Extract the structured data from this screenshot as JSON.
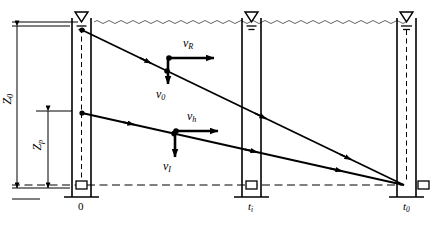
{
  "figure": {
    "type": "hydrogeology-well-drawdown-diagram",
    "background_color": "#ffffff",
    "line_color": "#000000",
    "width": 432,
    "height": 225
  },
  "water_table": {
    "symbol": "water-level-triangle",
    "wavy_line": true,
    "y": 22
  },
  "wells": [
    {
      "id": "well-left",
      "label": "0",
      "x": 78,
      "has_water_symbol": true,
      "has_dashed_riser": true,
      "has_screen_box": true
    },
    {
      "id": "well-middle",
      "label": "t",
      "label_sub": "i",
      "x": 249,
      "has_water_symbol": true,
      "has_dashed_riser": false,
      "has_screen_box": true
    },
    {
      "id": "well-right",
      "label": "t",
      "label_sub": "0",
      "x": 404,
      "has_water_symbol": true,
      "has_dashed_riser": true,
      "has_screen_box": true
    }
  ],
  "axis_labels": {
    "left_well": "0",
    "middle_well": "t",
    "middle_well_sub": "i",
    "right_well": "t",
    "right_well_sub": "0"
  },
  "dimensions": [
    {
      "name": "Z0",
      "label": "Z",
      "sub": "0",
      "orientation": "vertical",
      "from_y": 28,
      "to_y": 188,
      "x": 17,
      "description": "total aquifer depth"
    },
    {
      "name": "Zp",
      "label": "Z",
      "sub": "p",
      "orientation": "vertical",
      "from_y": 110,
      "to_y": 188,
      "x": 48,
      "description": "partial penetration depth"
    }
  ],
  "vectors": [
    {
      "name": "v-R",
      "label": "v",
      "sub": "R",
      "direction": "horizontal-right",
      "x": 196,
      "y": 57,
      "label_x": 186,
      "label_y": 40
    },
    {
      "name": "v-0",
      "label": "v",
      "sub": "0",
      "direction": "vertical-down",
      "x": 167,
      "y": 58,
      "label_x": 158,
      "label_y": 92
    },
    {
      "name": "v-h",
      "label": "v",
      "sub": "h",
      "direction": "horizontal-right",
      "x": 196,
      "y": 130,
      "label_x": 186,
      "label_y": 113
    },
    {
      "name": "v-I",
      "label": "v",
      "sub": "I",
      "direction": "vertical-down",
      "x": 174,
      "y": 131,
      "label_x": 165,
      "label_y": 163
    }
  ],
  "flow_lines": [
    {
      "name": "upper-drawdown-line",
      "from": [
        82,
        30
      ],
      "to": [
        404,
        185
      ],
      "arrow_positions": [
        0.33,
        0.62,
        0.88
      ]
    },
    {
      "name": "lower-drawdown-line",
      "from": [
        82,
        113
      ],
      "to": [
        404,
        185
      ],
      "arrow_positions": [
        0.3,
        0.58,
        0.85
      ]
    }
  ],
  "guides": {
    "baseline_dashed_y": 185,
    "top_solid_rule_y": 22,
    "bottom_solid_rule_y": 199
  }
}
